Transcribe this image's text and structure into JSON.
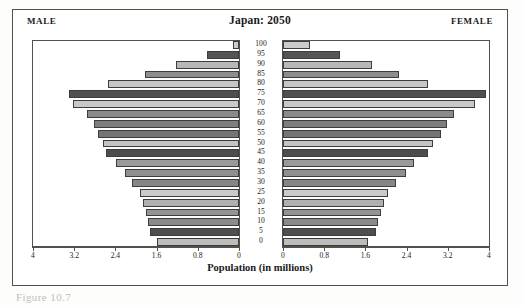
{
  "figure": {
    "caption": "Figure 10.7",
    "male_label": "MALE",
    "female_label": "FEMALE"
  },
  "chart_data": {
    "type": "bar",
    "subtype": "population-pyramid",
    "title": "Japan: 2050",
    "xlabel": "Population (in millions)",
    "ylabel": "",
    "grid": false,
    "legend": "none",
    "axis_note": "Horizontal axis is mirrored: male values increase leftward, female values increase rightward.",
    "xlim": [
      0,
      4
    ],
    "xticks": [
      0,
      0.8,
      1.6,
      2.4,
      3.2,
      4
    ],
    "xtick_labels_left": [
      "4",
      "3.2",
      "2.4",
      "1.6",
      "0.8",
      "0"
    ],
    "xtick_labels_right": [
      "0",
      "0.8",
      "1.6",
      "2.4",
      "3.2",
      "4"
    ],
    "categories": [
      "100",
      "95",
      "90",
      "85",
      "80",
      "75",
      "70",
      "65",
      "60",
      "55",
      "50",
      "45",
      "40",
      "35",
      "30",
      "25",
      "20",
      "15",
      "10",
      "5",
      "0"
    ],
    "series": [
      {
        "name": "MALE",
        "values": [
          0.12,
          0.62,
          1.22,
          1.82,
          2.55,
          3.3,
          3.22,
          2.95,
          2.82,
          2.74,
          2.64,
          2.58,
          2.38,
          2.22,
          2.08,
          1.92,
          1.86,
          1.8,
          1.76,
          1.72,
          1.6
        ]
      },
      {
        "name": "FEMALE",
        "values": [
          0.52,
          1.1,
          1.72,
          2.25,
          2.82,
          3.95,
          3.72,
          3.32,
          3.18,
          3.06,
          2.92,
          2.82,
          2.55,
          2.38,
          2.2,
          2.04,
          1.96,
          1.9,
          1.85,
          1.8,
          1.66
        ]
      }
    ],
    "bar_shades": [
      "#cccccc",
      "#555555",
      "#b8b8b8",
      "#8d8d8d",
      "#c6c6c6",
      "#4f4f4f",
      "#c9c9c9",
      "#8a8a8a",
      "#7e7e7e",
      "#757575",
      "#c4c4c4",
      "#4d4d4d",
      "#9a9a9a",
      "#8f8f8f",
      "#868686",
      "#cacaca",
      "#b0b0b0",
      "#949494",
      "#8b8b8b",
      "#4f4f4f",
      "#bdbdbd"
    ]
  },
  "colors": {
    "frame": "#55504c",
    "bar_outline": "#3d3d3d",
    "background": "#ffffff"
  }
}
